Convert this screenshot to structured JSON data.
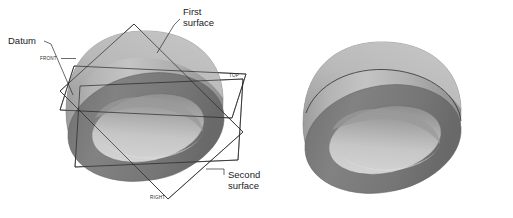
{
  "figure": {
    "background_color": "#ffffff",
    "title": "",
    "annotations": [
      {
        "id": "datum",
        "label": "Datum",
        "lines": [
          "Datum"
        ]
      },
      {
        "id": "first-surface",
        "label": "First surface",
        "lines": [
          "First",
          "surface"
        ]
      },
      {
        "id": "second-surface",
        "label": "Second surface",
        "lines": [
          "Second",
          "surface"
        ]
      }
    ],
    "datum_planes": [
      {
        "id": "front",
        "label": "FRONT"
      },
      {
        "id": "top",
        "label": "TOP"
      },
      {
        "id": "right",
        "label": "RIGHT"
      }
    ],
    "colors": {
      "outer_body_light": "#c2c2c2",
      "outer_body_mid": "#a8a8a8",
      "outer_body_dark": "#8e8e8e",
      "top_surface_light": "#bdbdbd",
      "top_surface_dark": "#9a9a9a",
      "rim_face": "#7b7b7b",
      "rim_face_dark": "#6d6d6d",
      "bore_light": "#d2d2d2",
      "bore_mid": "#b8b8b8",
      "bore_shadow": "#8c8c8c",
      "line": "#1e1e1e",
      "text": "#1a1a1a"
    },
    "views": [
      {
        "id": "left-view",
        "name": "annotated-ring-with-datum-planes"
      },
      {
        "id": "right-view",
        "name": "plain-ring-with-seam"
      }
    ]
  }
}
